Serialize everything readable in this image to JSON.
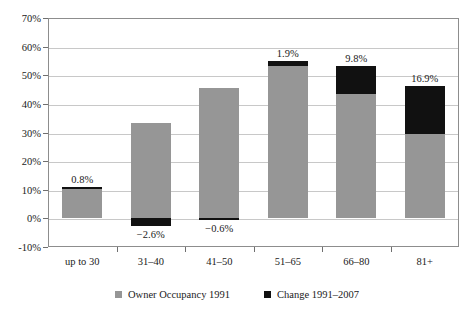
{
  "chart_data": {
    "type": "bar",
    "title": "",
    "subtitle": "",
    "xlabel": "",
    "ylabel": "",
    "stacked": true,
    "grid": true,
    "legend_position": "bottom",
    "ylim": [
      -10,
      70
    ],
    "ytick_step": 10,
    "ytick_labels": [
      "70%",
      "60%",
      "50%",
      "40%",
      "30%",
      "20%",
      "10%",
      "0%",
      "-10%"
    ],
    "ytick_values": [
      70,
      60,
      50,
      40,
      30,
      20,
      10,
      0,
      -10
    ],
    "categories": [
      "up to 30",
      "31–40",
      "41–50",
      "51–65",
      "66–80",
      "81+"
    ],
    "series": [
      {
        "name": "Owner Occupancy 1991",
        "color": "#969696",
        "values": [
          10.2,
          33.4,
          45.4,
          53.1,
          43.5,
          29.5
        ]
      },
      {
        "name": "Change 1991–2007",
        "color": "#111111",
        "values": [
          0.8,
          -2.6,
          -0.6,
          1.9,
          9.8,
          16.9
        ]
      }
    ],
    "data_labels": [
      "0.8%",
      "−2.6%",
      "−0.6%",
      "1.9%",
      "9.8%",
      "16.9%"
    ],
    "data_label_positions": [
      "above",
      "below",
      "below",
      "above",
      "above",
      "above"
    ]
  },
  "legend": {
    "items": [
      {
        "label": "Owner Occupancy 1991",
        "color": "#969696"
      },
      {
        "label": "Change 1991–2007",
        "color": "#111111"
      }
    ]
  },
  "colors": {
    "base": "#969696",
    "change": "#111111",
    "grid": "#c8c8c8",
    "axis": "#8d8d8d",
    "text": "#1a1a1a",
    "background": "#ffffff"
  }
}
